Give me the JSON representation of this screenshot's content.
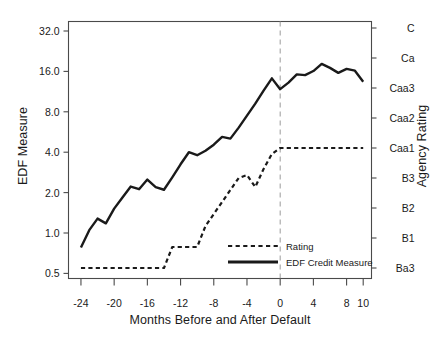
{
  "chart_data": {
    "type": "line",
    "title": "",
    "xlabel": "Months Before and After Default",
    "ylabel": "EDF Measure",
    "ylabel_right": "Agency Rating",
    "x_ticks": [
      "-24",
      "-20",
      "-16",
      "-12",
      "-8",
      "-4",
      "0",
      "4",
      "8",
      "10"
    ],
    "x_tick_values": [
      -24,
      -20,
      -16,
      -12,
      -8,
      -4,
      0,
      4,
      8,
      10
    ],
    "xlim": [
      -25.5,
      11.0
    ],
    "y_ticks_left": [
      "32.0",
      "16.0",
      "8.0",
      "4.0",
      "2.0",
      "1.0",
      "0.5"
    ],
    "y_tick_values_left": [
      32.0,
      16.0,
      8.0,
      4.0,
      2.0,
      1.0,
      0.5
    ],
    "y_axis_left_scale": "log2",
    "ylim_left": [
      0.42,
      45.0
    ],
    "y_ticks_right": [
      "C",
      "Ca",
      "Caa3",
      "Caa2",
      "Caa1",
      "B3",
      "B2",
      "B1",
      "Ba3"
    ],
    "y_tick_index_right": [
      9,
      8,
      7,
      6,
      5,
      4,
      3,
      2,
      1
    ],
    "grid": false,
    "annotations": [
      {
        "name": "default-line",
        "type": "vline",
        "x": 0,
        "style": "dashed",
        "color": "#9a9a9a"
      }
    ],
    "legend": {
      "position": "bottom-center",
      "entries": [
        {
          "label": "Rating",
          "style": "dashed",
          "color": "#1a1a1a"
        },
        {
          "label": "EDF Credit Measure",
          "style": "solid",
          "color": "#1a1a1a"
        }
      ]
    },
    "series": [
      {
        "name": "EDF Credit Measure",
        "style": "solid",
        "color": "#1a1a1a",
        "axis": "left",
        "x": [
          -24,
          -23,
          -22,
          -21,
          -20,
          -19,
          -18,
          -17,
          -16,
          -15,
          -14,
          -13,
          -12,
          -11,
          -10,
          -9,
          -8,
          -7,
          -6,
          -5,
          -4,
          -3,
          -2,
          -1,
          0,
          1,
          2,
          3,
          4,
          5,
          6,
          7,
          8,
          9,
          10
        ],
        "values": [
          0.78,
          1.05,
          1.28,
          1.18,
          1.52,
          1.84,
          2.22,
          2.12,
          2.5,
          2.2,
          2.1,
          2.6,
          3.25,
          4.0,
          3.8,
          4.1,
          4.55,
          5.2,
          5.05,
          6.1,
          7.5,
          9.2,
          11.5,
          14.2,
          11.8,
          13.2,
          15.2,
          15.0,
          16.1,
          18.2,
          17.0,
          15.6,
          16.7,
          16.2,
          13.4
        ]
      },
      {
        "name": "Rating",
        "style": "dashed",
        "color": "#1a1a1a",
        "axis": "right",
        "x": [
          -24,
          -23,
          -22,
          -21,
          -20,
          -19,
          -18,
          -17,
          -16,
          -15,
          -14,
          -13,
          -12,
          -11,
          -10,
          -9,
          -8,
          -7,
          -6,
          -5,
          -4,
          -3,
          -2,
          -1,
          0,
          1,
          2,
          3,
          4,
          5,
          6,
          7,
          8,
          9,
          10
        ],
        "values": [
          1.0,
          1.0,
          1.0,
          1.0,
          1.0,
          1.0,
          1.0,
          1.0,
          1.0,
          1.0,
          1.0,
          1.7,
          1.7,
          1.7,
          1.7,
          2.4,
          2.8,
          3.2,
          3.6,
          4.0,
          4.1,
          3.7,
          4.3,
          4.8,
          5.0,
          5.0,
          5.0,
          5.0,
          5.0,
          5.0,
          5.0,
          5.0,
          5.0,
          5.0,
          5.0
        ]
      }
    ]
  }
}
